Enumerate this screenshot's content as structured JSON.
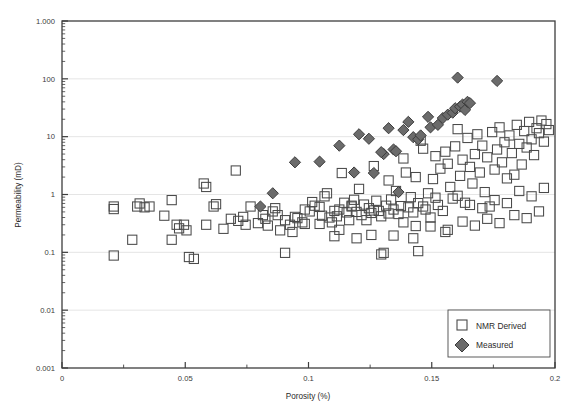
{
  "chart_data": {
    "type": "scatter",
    "title": "",
    "xlabel": "Porosity (%)",
    "ylabel": "Permeability (mD)",
    "xlim": [
      0,
      0.2
    ],
    "ylim": [
      0.001,
      1000
    ],
    "yscale": "log",
    "xscale": "linear",
    "grid": "horizontal-major-only",
    "legend_position": "bottom-right",
    "x_ticks": [
      "0",
      "0.05",
      "0.1",
      "0.15",
      "0.2"
    ],
    "x_tick_values": [
      0,
      0.05,
      0.1,
      0.15,
      0.2
    ],
    "x_minor_tick_values": [
      0.025,
      0.075,
      0.125,
      0.175
    ],
    "y_ticks": [
      "0.001",
      "0.01",
      "0.1",
      "1",
      "10",
      "100",
      "1.000"
    ],
    "y_tick_values": [
      0.001,
      0.01,
      0.1,
      1,
      10,
      100,
      1000
    ],
    "series": [
      {
        "name": "NMR Derived",
        "marker": "open-square",
        "color": "#4a4a4a",
        "fill": "none",
        "points": [
          [
            0.021,
            0.62
          ],
          [
            0.021,
            0.56
          ],
          [
            0.021,
            0.088
          ],
          [
            0.0305,
            0.62
          ],
          [
            0.0315,
            0.7
          ],
          [
            0.0335,
            0.6
          ],
          [
            0.0355,
            0.62
          ],
          [
            0.0285,
            0.165
          ],
          [
            0.0415,
            0.43
          ],
          [
            0.0445,
            0.165
          ],
          [
            0.0465,
            0.3
          ],
          [
            0.0475,
            0.26
          ],
          [
            0.0495,
            0.3
          ],
          [
            0.0505,
            0.24
          ],
          [
            0.0515,
            0.083
          ],
          [
            0.0535,
            0.077
          ],
          [
            0.0445,
            0.8
          ],
          [
            0.0585,
            0.3
          ],
          [
            0.0575,
            1.55
          ],
          [
            0.0585,
            1.35
          ],
          [
            0.0615,
            0.62
          ],
          [
            0.0625,
            0.68
          ],
          [
            0.0655,
            0.255
          ],
          [
            0.0705,
            2.6
          ],
          [
            0.0685,
            0.38
          ],
          [
            0.0715,
            0.35
          ],
          [
            0.0735,
            0.41
          ],
          [
            0.0745,
            0.3
          ],
          [
            0.0765,
            0.62
          ],
          [
            0.0795,
            0.32
          ],
          [
            0.0815,
            0.44
          ],
          [
            0.0825,
            0.38
          ],
          [
            0.0835,
            0.29
          ],
          [
            0.0865,
            0.58
          ],
          [
            0.0875,
            0.44
          ],
          [
            0.0885,
            0.24
          ],
          [
            0.0905,
            0.098
          ],
          [
            0.0925,
            0.3
          ],
          [
            0.0935,
            0.225
          ],
          [
            0.0955,
            0.39
          ],
          [
            0.0975,
            0.33
          ],
          [
            0.0985,
            0.55
          ],
          [
            0.1005,
            0.51
          ],
          [
            0.1015,
            0.74
          ],
          [
            0.1025,
            0.64
          ],
          [
            0.1045,
            0.31
          ],
          [
            0.1055,
            0.43
          ],
          [
            0.1065,
            0.93
          ],
          [
            0.1075,
            1.05
          ],
          [
            0.1085,
            0.4
          ],
          [
            0.1095,
            0.33
          ],
          [
            0.1105,
            0.52
          ],
          [
            0.1115,
            0.42
          ],
          [
            0.1125,
            0.55
          ],
          [
            0.1135,
            2.35
          ],
          [
            0.1145,
            0.72
          ],
          [
            0.1155,
            0.49
          ],
          [
            0.1165,
            0.36
          ],
          [
            0.1175,
            0.62
          ],
          [
            0.1185,
            0.81
          ],
          [
            0.1195,
            0.5
          ],
          [
            0.1205,
            1.25
          ],
          [
            0.1215,
            0.44
          ],
          [
            0.1225,
            0.67
          ],
          [
            0.1235,
            0.36
          ],
          [
            0.1245,
            0.58
          ],
          [
            0.1255,
            0.48
          ],
          [
            0.1265,
            3.1
          ],
          [
            0.1275,
            0.78
          ],
          [
            0.1285,
            0.52
          ],
          [
            0.1295,
            0.42
          ],
          [
            0.1305,
            0.098
          ],
          [
            0.1315,
            0.64
          ],
          [
            0.1325,
            1.75
          ],
          [
            0.1335,
            0.82
          ],
          [
            0.1345,
            0.55
          ],
          [
            0.1355,
            1.15
          ],
          [
            0.1365,
            0.46
          ],
          [
            0.1375,
            0.63
          ],
          [
            0.1385,
            4.2
          ],
          [
            0.1395,
            2.4
          ],
          [
            0.1405,
            0.6
          ],
          [
            0.1415,
            0.9
          ],
          [
            0.1425,
            0.49
          ],
          [
            0.1435,
            2.0
          ],
          [
            0.1445,
            0.71
          ],
          [
            0.1455,
            8.5
          ],
          [
            0.1465,
            6.2
          ],
          [
            0.1475,
            0.55
          ],
          [
            0.1485,
            1.05
          ],
          [
            0.1495,
            0.4
          ],
          [
            0.1505,
            1.85
          ],
          [
            0.1515,
            4.6
          ],
          [
            0.1525,
            0.66
          ],
          [
            0.1535,
            2.8
          ],
          [
            0.1545,
            0.52
          ],
          [
            0.1555,
            5.5
          ],
          [
            0.1565,
            3.4
          ],
          [
            0.1575,
            1.35
          ],
          [
            0.1585,
            0.85
          ],
          [
            0.1595,
            6.8
          ],
          [
            0.1605,
            13.5
          ],
          [
            0.1615,
            2.1
          ],
          [
            0.1625,
            4.0
          ],
          [
            0.1635,
            0.72
          ],
          [
            0.1645,
            9.5
          ],
          [
            0.1655,
            3.0
          ],
          [
            0.1665,
            1.55
          ],
          [
            0.1675,
            5.0
          ],
          [
            0.1685,
            11.0
          ],
          [
            0.1695,
            2.4
          ],
          [
            0.1705,
            7.0
          ],
          [
            0.1715,
            1.1
          ],
          [
            0.1725,
            4.4
          ],
          [
            0.1735,
            0.62
          ],
          [
            0.1745,
            12.0
          ],
          [
            0.1755,
            2.7
          ],
          [
            0.1765,
            6.0
          ],
          [
            0.1775,
            14.5
          ],
          [
            0.1785,
            3.6
          ],
          [
            0.1795,
            8.0
          ],
          [
            0.1805,
            1.9
          ],
          [
            0.1815,
            10.5
          ],
          [
            0.1825,
            5.2
          ],
          [
            0.1835,
            2.2
          ],
          [
            0.1845,
            16.0
          ],
          [
            0.1855,
            7.5
          ],
          [
            0.1865,
            3.3
          ],
          [
            0.1875,
            12.5
          ],
          [
            0.1885,
            6.5
          ],
          [
            0.1895,
            18.0
          ],
          [
            0.1905,
            9.0
          ],
          [
            0.1915,
            4.8
          ],
          [
            0.1925,
            14.0
          ],
          [
            0.1935,
            11.5
          ],
          [
            0.1945,
            19.0
          ],
          [
            0.1955,
            8.2
          ],
          [
            0.1965,
            16.5
          ],
          [
            0.1975,
            13.0
          ],
          [
            0.1435,
            0.285
          ],
          [
            0.1555,
            0.225
          ],
          [
            0.1265,
            0.53
          ],
          [
            0.1325,
            0.47
          ],
          [
            0.1385,
            0.33
          ],
          [
            0.1045,
            0.61
          ],
          [
            0.0985,
            0.31
          ],
          [
            0.1125,
            0.245
          ],
          [
            0.1465,
            0.62
          ],
          [
            0.1515,
            0.88
          ],
          [
            0.1605,
            0.95
          ],
          [
            0.1655,
            0.66
          ],
          [
            0.1705,
            0.58
          ],
          [
            0.1755,
            0.8
          ],
          [
            0.1805,
            0.71
          ],
          [
            0.1855,
            1.15
          ],
          [
            0.1905,
            0.93
          ],
          [
            0.1955,
            1.3
          ],
          [
            0.1195,
            0.175
          ],
          [
            0.1345,
            0.195
          ],
          [
            0.1255,
            0.2
          ],
          [
            0.1105,
            0.19
          ],
          [
            0.1425,
            0.175
          ],
          [
            0.1495,
            0.28
          ],
          [
            0.1565,
            0.245
          ],
          [
            0.1625,
            0.34
          ],
          [
            0.1675,
            0.29
          ],
          [
            0.1725,
            0.38
          ],
          [
            0.1775,
            0.32
          ],
          [
            0.1835,
            0.44
          ],
          [
            0.1885,
            0.39
          ],
          [
            0.1935,
            0.51
          ],
          [
            0.1295,
            0.092
          ],
          [
            0.1445,
            0.105
          ],
          [
            0.1175,
            0.64
          ],
          [
            0.0945,
            0.41
          ],
          [
            0.0905,
            0.36
          ],
          [
            0.0855,
            0.51
          ]
        ]
      },
      {
        "name": "Measured",
        "marker": "filled-diamond",
        "color": "#6b6b6b",
        "fill": "#6b6b6b",
        "points": [
          [
            0.0855,
            1.05
          ],
          [
            0.0805,
            0.62
          ],
          [
            0.0945,
            3.6
          ],
          [
            0.1045,
            3.7
          ],
          [
            0.1125,
            7.0
          ],
          [
            0.1185,
            2.4
          ],
          [
            0.1205,
            11.0
          ],
          [
            0.1245,
            9.2
          ],
          [
            0.1265,
            2.35
          ],
          [
            0.1305,
            5.0
          ],
          [
            0.1325,
            14.0
          ],
          [
            0.1345,
            6.0
          ],
          [
            0.1355,
            5.6
          ],
          [
            0.1365,
            1.1
          ],
          [
            0.1405,
            18.0
          ],
          [
            0.1425,
            9.8
          ],
          [
            0.1445,
            9.0
          ],
          [
            0.1455,
            10.5
          ],
          [
            0.1485,
            22.0
          ],
          [
            0.1495,
            14.5
          ],
          [
            0.1525,
            16.0
          ],
          [
            0.1545,
            21.0
          ],
          [
            0.1565,
            24.0
          ],
          [
            0.1585,
            26.0
          ],
          [
            0.1595,
            31.0
          ],
          [
            0.1605,
            105.0
          ],
          [
            0.1615,
            33.0
          ],
          [
            0.1625,
            36.0
          ],
          [
            0.1635,
            29.0
          ],
          [
            0.1645,
            40.0
          ],
          [
            0.1655,
            38.0
          ],
          [
            0.1765,
            92.0
          ],
          [
            0.1295,
            5.4
          ],
          [
            0.1385,
            13.0
          ]
        ]
      }
    ]
  },
  "legend": {
    "entries": [
      {
        "label": "NMR Derived",
        "marker": "open-square"
      },
      {
        "label": "Measured",
        "marker": "filled-diamond"
      }
    ]
  },
  "colors": {
    "square_stroke": "#4a4a4a",
    "diamond_fill": "#6b6b6b",
    "diamond_stroke": "#3c3c3c",
    "axis": "#3d3d3d",
    "grid": "#e2e2e2",
    "text": "#2b2b2b",
    "background": "#ffffff"
  }
}
